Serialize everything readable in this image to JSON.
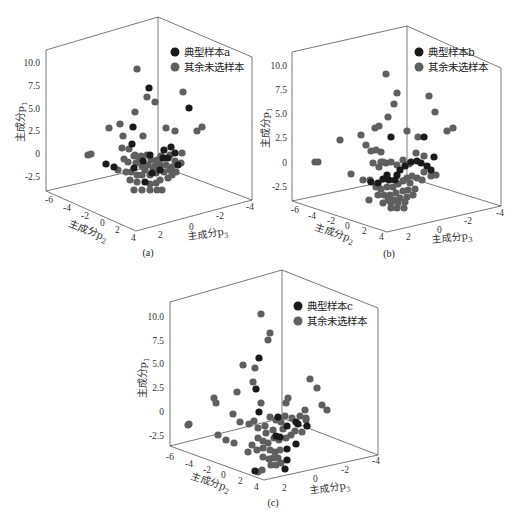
{
  "colors": {
    "typical": "#1a1a1a",
    "other": "#5f5f5f",
    "frame": "#555555"
  },
  "axes": {
    "zlabel": "主成分p",
    "zsub": "1",
    "xlabel": "主成分p",
    "xsub": "2",
    "ylabel": "主成分p",
    "ysub": "3",
    "zticks": [
      "10.0",
      "7.5",
      "5.0",
      "2.5",
      "0",
      "-2.5"
    ],
    "p2ticks": [
      "-6",
      "-4",
      "-2",
      "0",
      "2",
      "4"
    ],
    "p3ticks": [
      "2",
      "0",
      "-2",
      "-4"
    ]
  },
  "panels": [
    {
      "caption": "(a)",
      "legend_typical": "典型样本a",
      "legend_other": "其余未选样本"
    },
    {
      "caption": "(b)",
      "legend_typical": "典型样本b",
      "legend_other": "其余未选样本"
    },
    {
      "caption": "(c)",
      "legend_typical": "典型样本c",
      "legend_other": "其余未选样本"
    }
  ],
  "chart_data": [
    {
      "type": "scatter",
      "title": "(a)",
      "xlabel": "主成分p2",
      "ylabel": "主成分p3",
      "zlabel": "主成分p1",
      "xlim": [
        -6,
        4
      ],
      "ylim": [
        -4,
        4
      ],
      "zlim": [
        -3.5,
        11
      ],
      "legend": [
        "典型样本a",
        "其余未选样本"
      ],
      "series": [
        {
          "name": "典型样本a",
          "color": "#1a1a1a",
          "points_px": [
            [
              149,
              88
            ],
            [
              189,
              108
            ],
            [
              133,
              127
            ],
            [
              132,
              144
            ],
            [
              171,
              147
            ],
            [
              106,
              164
            ],
            [
              114,
              167
            ],
            [
              150,
              155
            ],
            [
              164,
              150
            ],
            [
              175,
              153
            ],
            [
              134,
              168
            ],
            [
              160,
              170
            ],
            [
              145,
              182
            ],
            [
              178,
              165
            ],
            [
              163,
              158
            ],
            [
              168,
              158
            ],
            [
              152,
              173
            ],
            [
              143,
              161
            ]
          ]
        },
        {
          "name": "其余未选样本",
          "color": "#5f5f5f",
          "points_px": [
            [
              137,
              69
            ],
            [
              147,
              97
            ],
            [
              135,
              112
            ],
            [
              155,
              102
            ],
            [
              109,
              128
            ],
            [
              120,
              124
            ],
            [
              183,
              92
            ],
            [
              123,
              136
            ],
            [
              143,
              136
            ],
            [
              166,
              128
            ],
            [
              175,
              131
            ],
            [
              197,
              131
            ],
            [
              202,
              127
            ],
            [
              88,
              155
            ],
            [
              91,
              154
            ],
            [
              122,
              148
            ],
            [
              129,
              149
            ],
            [
              124,
              159
            ],
            [
              135,
              155
            ],
            [
              141,
              156
            ],
            [
              147,
              155
            ],
            [
              151,
              160
            ],
            [
              157,
              160
            ],
            [
              161,
              156
            ],
            [
              165,
              158
            ],
            [
              170,
              155
            ],
            [
              175,
              161
            ],
            [
              182,
              153
            ],
            [
              181,
              163
            ],
            [
              128,
              162
            ],
            [
              136,
              163
            ],
            [
              142,
              166
            ],
            [
              148,
              165
            ],
            [
              155,
              166
            ],
            [
              160,
              165
            ],
            [
              166,
              165
            ],
            [
              172,
              167
            ],
            [
              118,
              170
            ],
            [
              126,
              172
            ],
            [
              131,
              172
            ],
            [
              137,
              175
            ],
            [
              142,
              175
            ],
            [
              150,
              175
            ],
            [
              156,
              173
            ],
            [
              164,
              172
            ],
            [
              170,
              170
            ],
            [
              176,
              172
            ],
            [
              130,
              180
            ],
            [
              137,
              182
            ],
            [
              150,
              184
            ],
            [
              156,
              183
            ],
            [
              160,
              180
            ],
            [
              168,
              178
            ],
            [
              142,
              190
            ],
            [
              150,
              190
            ],
            [
              157,
              190
            ],
            [
              162,
              190
            ],
            [
              134,
              190
            ],
            [
              172,
              175
            ],
            [
              159,
              162
            ],
            [
              145,
              170
            ],
            [
              153,
              168
            ],
            [
              134,
              156
            ],
            [
              139,
              159
            ]
          ]
        }
      ]
    },
    {
      "type": "scatter",
      "title": "(b)",
      "xlabel": "主成分p2",
      "ylabel": "主成分p3",
      "zlabel": "主成分p1",
      "xlim": [
        -6,
        4
      ],
      "ylim": [
        -4,
        4
      ],
      "zlim": [
        -3.5,
        11
      ],
      "legend": [
        "典型样本b",
        "其余未选样本"
      ],
      "series": [
        {
          "name": "典型样本b",
          "color": "#1a1a1a",
          "points_px": [
            [
              131,
              137
            ],
            [
              164,
              137
            ],
            [
              174,
              157
            ],
            [
              151,
              162
            ],
            [
              157,
              161
            ],
            [
              161,
              163
            ],
            [
              167,
              166
            ],
            [
              171,
              170
            ],
            [
              145,
              166
            ],
            [
              140,
              170
            ],
            [
              137,
              175
            ],
            [
              127,
              175
            ],
            [
              123,
              179
            ],
            [
              118,
              183
            ],
            [
              111,
              182
            ],
            [
              135,
              180
            ],
            [
              129,
              180
            ]
          ]
        },
        {
          "name": "其余未选样本",
          "color": "#5f5f5f",
          "points_px": [
            [
              126,
              74
            ],
            [
              137,
              93
            ],
            [
              134,
              104
            ],
            [
              128,
              117
            ],
            [
              119,
              126
            ],
            [
              101,
              135
            ],
            [
              115,
              128
            ],
            [
              80,
              140
            ],
            [
              106,
              145
            ],
            [
              111,
              151
            ],
            [
              116,
              150
            ],
            [
              121,
              152
            ],
            [
              123,
              162
            ],
            [
              147,
              131
            ],
            [
              169,
              96
            ],
            [
              175,
              112
            ],
            [
              187,
              131
            ],
            [
              193,
              128
            ],
            [
              158,
              137
            ],
            [
              156,
              153
            ],
            [
              164,
              156
            ],
            [
              55,
              162
            ],
            [
              58,
              162
            ],
            [
              91,
              174
            ],
            [
              103,
              180
            ],
            [
              110,
              180
            ],
            [
              121,
              162
            ],
            [
              113,
              163
            ],
            [
              119,
              167
            ],
            [
              126,
              163
            ],
            [
              131,
              162
            ],
            [
              137,
              165
            ],
            [
              143,
              160
            ],
            [
              149,
              164
            ],
            [
              164,
              172
            ],
            [
              171,
              176
            ],
            [
              176,
              175
            ],
            [
              116,
              187
            ],
            [
              121,
              189
            ],
            [
              127,
              187
            ],
            [
              133,
              187
            ],
            [
              138,
              184
            ],
            [
              143,
              181
            ],
            [
              147,
              178
            ],
            [
              152,
              176
            ],
            [
              157,
              178
            ],
            [
              162,
              180
            ],
            [
              118,
              195
            ],
            [
              124,
              195
            ],
            [
              130,
              195
            ],
            [
              136,
              193
            ],
            [
              143,
              191
            ],
            [
              148,
              190
            ],
            [
              155,
              189
            ],
            [
              128,
              200
            ],
            [
              134,
              200
            ],
            [
              140,
              198
            ],
            [
              147,
              197
            ],
            [
              153,
              195
            ],
            [
              123,
              203
            ],
            [
              131,
              203
            ],
            [
              138,
              203
            ],
            [
              145,
              202
            ],
            [
              131,
              208
            ],
            [
              137,
              208
            ],
            [
              144,
              208
            ],
            [
              109,
              200
            ],
            [
              150,
              183
            ]
          ]
        }
      ]
    },
    {
      "type": "scatter",
      "title": "(c)",
      "xlabel": "主成分p2",
      "ylabel": "主成分p3",
      "zlabel": "主成分p1",
      "xlim": [
        -6,
        4
      ],
      "ylim": [
        -4,
        4
      ],
      "zlim": [
        -3.5,
        11
      ],
      "legend": [
        "典型样本c",
        "其余未选样本"
      ],
      "series": [
        {
          "name": "典型样本c",
          "color": "#1a1a1a",
          "points_px": [
            [
              99,
              58
            ],
            [
              96,
              89
            ],
            [
              99,
              112
            ],
            [
              118,
              117
            ],
            [
              127,
              126
            ],
            [
              138,
              124
            ],
            [
              136,
              122
            ],
            [
              147,
              126
            ],
            [
              136,
              144
            ],
            [
              127,
              149
            ],
            [
              116,
              136
            ],
            [
              95,
              171
            ],
            [
              120,
              137
            ],
            [
              127,
              160
            ],
            [
              125,
              169
            ]
          ]
        },
        {
          "name": "其余未选样本",
          "color": "#5f5f5f",
          "points_px": [
            [
              101,
              14
            ],
            [
              110,
              33
            ],
            [
              108,
              40
            ],
            [
              95,
              68
            ],
            [
              83,
              65
            ],
            [
              93,
              82
            ],
            [
              77,
              92
            ],
            [
              73,
              114
            ],
            [
              80,
              122
            ],
            [
              56,
              103
            ],
            [
              54,
              98
            ],
            [
              101,
              103
            ],
            [
              128,
              98
            ],
            [
              126,
              103
            ],
            [
              150,
              79
            ],
            [
              157,
              88
            ],
            [
              162,
              105
            ],
            [
              167,
              110
            ],
            [
              145,
              110
            ],
            [
              146,
              120
            ],
            [
              28,
              125
            ],
            [
              29,
              124
            ],
            [
              58,
              135
            ],
            [
              66,
              140
            ],
            [
              74,
              143
            ],
            [
              89,
              124
            ],
            [
              94,
              121
            ],
            [
              98,
              128
            ],
            [
              105,
              126
            ],
            [
              110,
              117
            ],
            [
              116,
              120
            ],
            [
              121,
              122
            ],
            [
              125,
              116
            ],
            [
              132,
              118
            ],
            [
              140,
              116
            ],
            [
              146,
              118
            ],
            [
              98,
              138
            ],
            [
              103,
              141
            ],
            [
              108,
              143
            ],
            [
              114,
              138
            ],
            [
              119,
              140
            ],
            [
              126,
              138
            ],
            [
              131,
              135
            ],
            [
              135,
              131
            ],
            [
              142,
              132
            ],
            [
              92,
              145
            ],
            [
              97,
              150
            ],
            [
              103,
              148
            ],
            [
              110,
              150
            ],
            [
              115,
              152
            ],
            [
              120,
              150
            ],
            [
              103,
              157
            ],
            [
              109,
              159
            ],
            [
              113,
              158
            ],
            [
              118,
              158
            ],
            [
              111,
              165
            ],
            [
              116,
              165
            ],
            [
              121,
              163
            ],
            [
              88,
              152
            ],
            [
              113,
              130
            ],
            [
              123,
              129
            ],
            [
              106,
              133
            ],
            [
              98,
              172
            ],
            [
              102,
              170
            ]
          ]
        }
      ]
    }
  ]
}
